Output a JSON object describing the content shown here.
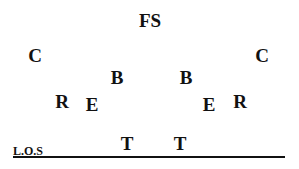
{
  "diagram": {
    "type": "football-defensive-formation",
    "line_of_scrimmage": {
      "label": "L.O.S"
    },
    "players": [
      {
        "id": "fs",
        "label": "FS",
        "x": 150,
        "y": 20
      },
      {
        "id": "c-left",
        "label": "C",
        "x": 35,
        "y": 55
      },
      {
        "id": "c-right",
        "label": "C",
        "x": 262,
        "y": 55
      },
      {
        "id": "b-left",
        "label": "B",
        "x": 117,
        "y": 77
      },
      {
        "id": "b-right",
        "label": "B",
        "x": 186,
        "y": 77
      },
      {
        "id": "r-left",
        "label": "R",
        "x": 62,
        "y": 101
      },
      {
        "id": "e-left",
        "label": "E",
        "x": 92,
        "y": 104
      },
      {
        "id": "e-right",
        "label": "E",
        "x": 209,
        "y": 104
      },
      {
        "id": "r-right",
        "label": "R",
        "x": 240,
        "y": 101
      },
      {
        "id": "t-left",
        "label": "T",
        "x": 127,
        "y": 143
      },
      {
        "id": "t-right",
        "label": "T",
        "x": 180,
        "y": 143
      }
    ]
  }
}
